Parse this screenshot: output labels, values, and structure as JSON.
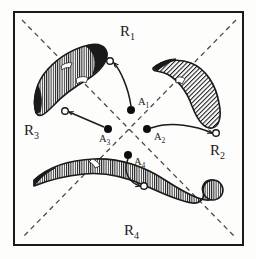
{
  "figure": {
    "background_color": "#fdfdfc",
    "ink_color": "#1a1a1a",
    "frame": {
      "name": "outer-frame",
      "x": 14,
      "y": 12,
      "width": 229,
      "height": 233,
      "stroke_color": "#1a1a1a",
      "stroke_width": 2
    },
    "diagonals": [
      {
        "name": "diagonal-nw-se",
        "x1": 22,
        "y1": 20,
        "x2": 236,
        "y2": 238,
        "dash": "5 4",
        "color": "#4a4a4a"
      },
      {
        "name": "diagonal-ne-sw",
        "x1": 236,
        "y1": 20,
        "x2": 22,
        "y2": 238,
        "dash": "5 4",
        "color": "#4a4a4a"
      }
    ],
    "region_labels": [
      {
        "name": "region-label-r1",
        "base": "R",
        "sub": "1",
        "x": 120,
        "y": 36
      },
      {
        "name": "region-label-r2",
        "base": "R",
        "sub": "2",
        "x": 210,
        "y": 155
      },
      {
        "name": "region-label-r3",
        "base": "R",
        "sub": "3",
        "x": 24,
        "y": 135
      },
      {
        "name": "region-label-r4",
        "base": "R",
        "sub": "4",
        "x": 124,
        "y": 235
      }
    ],
    "points": [
      {
        "name": "point-a1",
        "base": "A",
        "sub": "1",
        "cx": 131,
        "cy": 110,
        "r": 4.0,
        "label_x": 138,
        "label_y": 105
      },
      {
        "name": "point-a2",
        "base": "A",
        "sub": "2",
        "cx": 147,
        "cy": 129,
        "r": 4.0,
        "label_x": 154,
        "label_y": 140
      },
      {
        "name": "point-a3",
        "base": "A",
        "sub": "3",
        "cx": 108,
        "cy": 129,
        "r": 4.0,
        "label_x": 99,
        "label_y": 142
      },
      {
        "name": "point-a4",
        "base": "A",
        "sub": "4",
        "cx": 128,
        "cy": 155,
        "r": 4.0,
        "label_x": 134,
        "label_y": 165
      }
    ],
    "open_circles": [
      {
        "name": "open-circle-r1",
        "cx": 110,
        "cy": 61,
        "r": 3.3
      },
      {
        "name": "open-circle-r2",
        "cx": 216,
        "cy": 133,
        "r": 3.3
      },
      {
        "name": "open-circle-r3",
        "cx": 65,
        "cy": 111,
        "r": 3.3
      },
      {
        "name": "open-circle-r4",
        "cx": 144,
        "cy": 186,
        "r": 3.3
      }
    ],
    "arrows": [
      {
        "name": "arrow-a1-to-r1",
        "from": "A1",
        "to": "open-circle-r1",
        "path": "M 131 106 C 128 86 120 70 114 63"
      },
      {
        "name": "arrow-a2-to-r2",
        "from": "A2",
        "to": "open-circle-r2",
        "path": "M 151 128 C 172 121 196 126 212 133"
      },
      {
        "name": "arrow-a3-to-r3",
        "from": "A3",
        "to": "open-circle-r3",
        "path": "M 104 127 L 69 112"
      },
      {
        "name": "arrow-a4-to-r4",
        "from": "A4",
        "to": "open-circle-r4",
        "path": "M 128 159 C 122 172 130 183 140 186"
      }
    ],
    "blobs": [
      {
        "name": "blob-r1-upper-left",
        "region": "R3/R1 boundary, upper-left",
        "fill": "hatched-vertical",
        "outline_color": "#1a1a1a",
        "path": "M 36 113 C 32 99 36 82 48 69 C 60 56 76 48 89 45 C 99 43 106 46 107 53 C 108 62 99 72 88 79 C 76 86 62 96 53 106 C 46 113 40 119 36 113 Z"
      },
      {
        "name": "blob-r2-upper-right",
        "region": "R1/R2 boundary, upper-right",
        "fill": "hatched-diagonal",
        "outline_color": "#1a1a1a",
        "path": "M 153 68 C 163 60 178 58 191 63 C 206 69 216 85 219 103 C 222 117 219 127 212 128 C 204 129 197 119 192 106 C 187 92 178 80 167 74 C 159 70 152 72 153 68 Z"
      },
      {
        "name": "blob-r4-lower",
        "region": "R3/R4/R2 sweeping band, lower",
        "fill": "hatched-vertical",
        "outline_color": "#1a1a1a",
        "path": "M 34 180 C 48 167 70 160 94 159 C 120 158 145 167 165 180 C 182 191 196 199 206 200 C 214 201 218 196 219 191 C 221 185 217 180 211 180 C 205 180 201 186 203 192 C 205 198 200 204 192 203 C 178 201 162 193 146 186 C 126 177 104 172 84 174 C 62 176 44 182 34 186 Z"
      }
    ],
    "hatching": {
      "vertical": {
        "name": "hatch-vertical",
        "spacing": 2,
        "stroke_width": 1,
        "color": "#1a1a1a"
      },
      "diagonal": {
        "name": "hatch-diagonal",
        "spacing": 2.4,
        "stroke_width": 0.9,
        "color": "#1a1a1a",
        "angle_degrees": 45
      }
    }
  }
}
